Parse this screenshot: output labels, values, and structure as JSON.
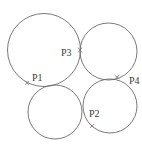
{
  "diagram": {
    "width": 142,
    "height": 150,
    "background": "#ffffff",
    "stroke_color": "#6a6a6a",
    "circles": [
      {
        "id": "large-top-left",
        "cx": 44,
        "cy": 50,
        "r": 36.5
      },
      {
        "id": "top-right",
        "cx": 108.5,
        "cy": 51.5,
        "r": 28.5
      },
      {
        "id": "bottom-left",
        "cx": 55,
        "cy": 112,
        "r": 27
      },
      {
        "id": "bottom-right",
        "cx": 110,
        "cy": 106,
        "r": 27
      }
    ],
    "points": [
      {
        "label": "P1",
        "mark_x": 27,
        "mark_y": 83,
        "label_x": 32,
        "label_y": 81
      },
      {
        "label": "P2",
        "mark_x": 92,
        "mark_y": 126,
        "label_x": 89,
        "label_y": 117
      },
      {
        "label": "P3",
        "mark_x": 80,
        "mark_y": 50,
        "label_x": 61,
        "label_y": 56
      },
      {
        "label": "P4",
        "mark_x": 117,
        "mark_y": 77,
        "label_x": 129,
        "label_y": 84
      }
    ]
  }
}
